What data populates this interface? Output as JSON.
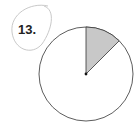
{
  "problem": {
    "number_label": "13.",
    "circled": true
  },
  "figure": {
    "type": "circle-fraction",
    "total_parts": 8,
    "shaded_parts": 1,
    "shaded_start_deg": 0,
    "shaded_end_deg": 45,
    "colors": {
      "shade": "#c8c8c8",
      "outline": "#333333",
      "circle_mark": "#c9c9c9"
    }
  }
}
